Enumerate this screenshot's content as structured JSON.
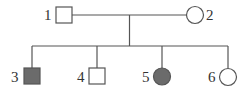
{
  "diagram": {
    "type": "pedigree",
    "colors": {
      "line": "#555555",
      "affected_fill": "#6b6b6b",
      "unaffected_fill": "#ffffff",
      "label": "#333333"
    },
    "generation_1": [
      {
        "id": "1",
        "label": "1",
        "sex": "male",
        "affected": false
      },
      {
        "id": "2",
        "label": "2",
        "sex": "female",
        "affected": false
      }
    ],
    "generation_2": [
      {
        "id": "3",
        "label": "3",
        "sex": "male",
        "affected": true
      },
      {
        "id": "4",
        "label": "4",
        "sex": "male",
        "affected": false
      },
      {
        "id": "5",
        "label": "5",
        "sex": "female",
        "affected": true
      },
      {
        "id": "6",
        "label": "6",
        "sex": "female",
        "affected": false
      }
    ]
  }
}
